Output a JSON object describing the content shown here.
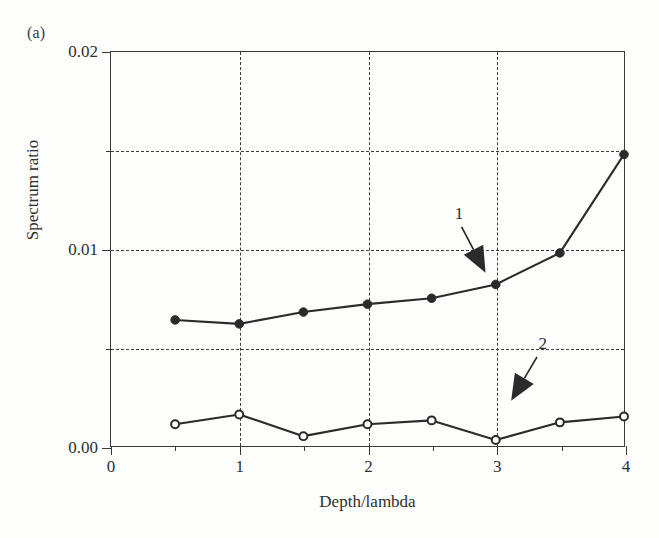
{
  "figure": {
    "panel_label": "(a)",
    "xlabel": "Depth/lambda",
    "ylabel": "Spectrum ratio"
  },
  "axes": {
    "y_ticks": [
      "0.00",
      "0.01",
      "0.02"
    ],
    "x_ticks": [
      "0",
      "1",
      "2",
      "3",
      "4"
    ]
  },
  "annotations": {
    "one": "1",
    "two": "2"
  },
  "colors": {
    "line": "#2b2b2b",
    "grid": "#3d3d3d",
    "frame": "#3a3a3a",
    "background": "#fdfdfc"
  },
  "chart_data": {
    "type": "line",
    "title": "",
    "xlabel": "Depth/lambda",
    "ylabel": "Spectrum ratio",
    "xlim": [
      0,
      4
    ],
    "ylim": [
      0.0,
      0.02
    ],
    "x_major_ticks": [
      0,
      1,
      2,
      3,
      4
    ],
    "x_minor_ticks": [
      0.5,
      1.5,
      2.5,
      3.5
    ],
    "y_major_ticks": [
      0.0,
      0.01,
      0.02
    ],
    "y_minor_ticks": [
      0.005,
      0.015
    ],
    "grid": true,
    "grid_style": "dashed",
    "grid_lines_x": [
      1,
      2,
      3
    ],
    "grid_lines_y": [
      0.005,
      0.01,
      0.015
    ],
    "legend": "none",
    "x": [
      0.5,
      1.0,
      1.5,
      2.0,
      2.5,
      3.0,
      3.5,
      4.0
    ],
    "series": [
      {
        "name": "1",
        "marker": "filled-circle",
        "label": "1",
        "values": [
          0.0064,
          0.0062,
          0.0068,
          0.0072,
          0.0075,
          0.0082,
          0.0098,
          0.0148
        ]
      },
      {
        "name": "2",
        "marker": "open-circle",
        "label": "2",
        "values": [
          0.0011,
          0.0016,
          0.0005,
          0.0011,
          0.0013,
          0.0003,
          0.0012,
          0.0015
        ]
      }
    ],
    "annotations": [
      {
        "text": "1",
        "points_to_series": "1",
        "at_x": 2.92,
        "at_y": 0.0088
      },
      {
        "text": "2",
        "points_to_series": "2",
        "at_x": 3.12,
        "at_y": 0.0023
      }
    ]
  }
}
